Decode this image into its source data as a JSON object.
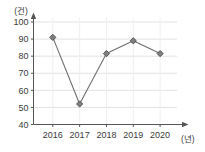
{
  "chart_data": {
    "type": "line",
    "title": "",
    "xlabel": "(년)",
    "ylabel": "(건)",
    "categories": [
      "2016",
      "2017",
      "2018",
      "2019",
      "2020"
    ],
    "values": [
      91,
      52,
      81.5,
      89,
      81.5
    ],
    "series": [
      {
        "name": "",
        "values": [
          91,
          52,
          81.5,
          89,
          81.5
        ]
      }
    ],
    "ylim": [
      40,
      100
    ],
    "yticks": [
      "40",
      "50",
      "60",
      "70",
      "80",
      "90",
      "100"
    ],
    "ytick_values": [
      40,
      50,
      60,
      70,
      80,
      90,
      100
    ],
    "grid": true,
    "grid_horizontal": true,
    "grid_vertical": true,
    "legend": false,
    "legend_position": "none",
    "marker": "diamond",
    "colors": {
      "line": "#6e6e6e",
      "marker_fill": "#808080",
      "marker_edge": "#4a4a4a",
      "grid": "#e2e2e2",
      "axis": "#555555",
      "text": "#3a3a3a",
      "background": "#ffffff"
    }
  },
  "axes": {
    "y_unit_label": "(건)",
    "x_unit_label": "(년)"
  }
}
